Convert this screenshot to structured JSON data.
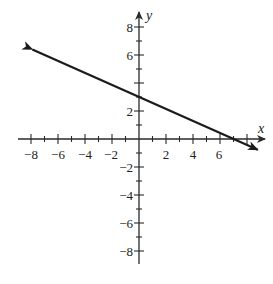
{
  "chart_data": {
    "type": "line",
    "title": "",
    "xlabel": "x",
    "ylabel": "y",
    "xlim": [
      -8.5,
      9.3
    ],
    "ylim": [
      -8.8,
      9.0
    ],
    "grid": false,
    "legend": null,
    "x_ticks": [
      -8,
      -7,
      -6,
      -5,
      -4,
      -3,
      -2,
      -1,
      1,
      2,
      3,
      4,
      5,
      6,
      7,
      8
    ],
    "x_tick_labels": [
      "-8",
      "-6",
      "-4",
      "-2",
      "2",
      "4",
      "6"
    ],
    "x_tick_label_values": [
      -8,
      -6,
      -4,
      -2,
      2,
      4,
      6
    ],
    "y_ticks": [
      -8,
      -7,
      -6,
      -5,
      -4,
      -3,
      -2,
      -1,
      1,
      2,
      3,
      4,
      5,
      6,
      7,
      8
    ],
    "y_tick_labels": [
      "8",
      "6",
      "2",
      "-2",
      "-4",
      "-6",
      "-8"
    ],
    "y_tick_label_values": [
      8,
      6,
      2,
      -2,
      -4,
      -6,
      -8
    ],
    "series": [
      {
        "name": "line",
        "equation": "3x + 7y = 21",
        "slope": -0.4286,
        "y_intercept": 3,
        "x_intercept": 7,
        "x": [
          -7.9,
          8.8
        ],
        "y": [
          6.4,
          -0.77
        ],
        "arrows": "both",
        "color": "#1a1a1a"
      }
    ]
  },
  "labels": {
    "x_axis": "x",
    "y_axis": "y",
    "x_ticks": [
      "−8",
      "−6",
      "−4",
      "−2",
      "2",
      "4",
      "6"
    ],
    "y_ticks": [
      "8",
      "6",
      "2",
      "−2",
      "−4",
      "−6",
      "−8"
    ]
  },
  "colors": {
    "axis": "#2a2a2a",
    "line": "#1a1a1a",
    "background": "#ffffff"
  }
}
